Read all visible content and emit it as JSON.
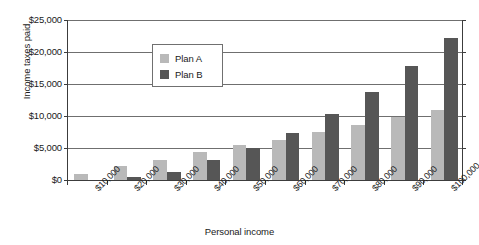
{
  "chart_data": {
    "type": "bar",
    "title": "",
    "xlabel": "Personal income",
    "ylabel": "Income taxes paid",
    "categories": [
      "$10,000",
      "$20,000",
      "$30,000",
      "$40,000",
      "$50,000",
      "$60,000",
      "$70,000",
      "$80,000",
      "$90,000",
      "$100,000"
    ],
    "series": [
      {
        "name": "Plan A",
        "color": "#b9b9b9",
        "values": [
          1000,
          2200,
          3200,
          4300,
          5400,
          6300,
          7500,
          8600,
          9900,
          11000
        ]
      },
      {
        "name": "Plan B",
        "color": "#565656",
        "values": [
          0,
          500,
          1300,
          3100,
          5000,
          7300,
          10300,
          13800,
          17800,
          22200
        ]
      }
    ],
    "ylim": [
      0,
      25000
    ],
    "y_ticks": [
      0,
      5000,
      10000,
      15000,
      20000,
      25000
    ],
    "y_tick_labels": [
      "$0",
      "$5,000",
      "$10,000",
      "$15,000",
      "$20,000",
      "$25,000"
    ],
    "grid": true,
    "legend_position": "upper-center-left"
  },
  "legend": {
    "entries": [
      {
        "label": "Plan A"
      },
      {
        "label": "Plan B"
      }
    ]
  },
  "colors": {
    "series_a": "#b9b9b9",
    "series_b": "#565656",
    "axis": "#3c3c3c",
    "gridline": "#6f6f6f",
    "background": "#ffffff"
  }
}
